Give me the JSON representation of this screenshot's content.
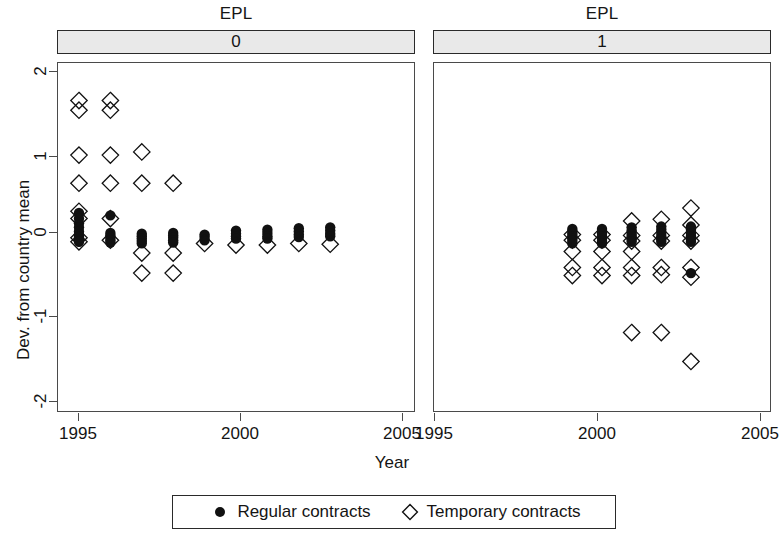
{
  "figure": {
    "strip_variable": "EPL",
    "panels": [
      {
        "strip_title": "EPL",
        "strip_value": "0"
      },
      {
        "strip_title": "EPL",
        "strip_value": "1"
      }
    ],
    "axis": {
      "ylabel": "Dev. from country mean",
      "xlabel": "Year",
      "yticks": [
        "2",
        "1",
        "0",
        "-1",
        "-2"
      ],
      "xticks": [
        "1995",
        "2000",
        "2005"
      ]
    },
    "legend": {
      "entries": [
        {
          "symbol": "filled-circle",
          "label": "Regular contracts"
        },
        {
          "symbol": "open-diamond",
          "label": "Temporary contracts"
        }
      ]
    },
    "colors": {
      "marker": "#111111",
      "strip_fill": "#e9e9e9",
      "frame": "#4a4a4a",
      "text": "#141414"
    }
  },
  "chart_data": {
    "type": "scatter",
    "title": "EPL",
    "xlabel": "Year",
    "ylabel": "Dev. from country mean",
    "xlim": [
      1994.3,
      2005.7
    ],
    "ylim": [
      -2.18,
      2.18
    ],
    "xticks": [
      1995,
      2000,
      2005
    ],
    "yticks": [
      -2,
      -1,
      0,
      1,
      2
    ],
    "grid": false,
    "legend_position": "bottom",
    "facet_variable": "EPL",
    "facets": [
      {
        "facet_value": "0",
        "series": [
          {
            "name": "Regular contracts",
            "marker": "filled-circle",
            "points": [
              {
                "x": 1995,
                "y": 0.3
              },
              {
                "x": 1995,
                "y": 0.23
              },
              {
                "x": 1995,
                "y": 0.17
              },
              {
                "x": 1995,
                "y": 0.12
              },
              {
                "x": 1995,
                "y": 0.07
              },
              {
                "x": 1995,
                "y": 0.03
              },
              {
                "x": 1995,
                "y": 0.0
              },
              {
                "x": 1995,
                "y": -0.03
              },
              {
                "x": 1995,
                "y": -0.06
              },
              {
                "x": 1996,
                "y": 0.27
              },
              {
                "x": 1996,
                "y": 0.05
              },
              {
                "x": 1996,
                "y": 0.02
              },
              {
                "x": 1996,
                "y": -0.01
              },
              {
                "x": 1996,
                "y": -0.04
              },
              {
                "x": 1996,
                "y": -0.07
              },
              {
                "x": 1997,
                "y": 0.04
              },
              {
                "x": 1997,
                "y": 0.01
              },
              {
                "x": 1997,
                "y": -0.02
              },
              {
                "x": 1997,
                "y": -0.05
              },
              {
                "x": 1997,
                "y": -0.08
              },
              {
                "x": 1998,
                "y": 0.05
              },
              {
                "x": 1998,
                "y": 0.02
              },
              {
                "x": 1998,
                "y": -0.01
              },
              {
                "x": 1998,
                "y": -0.04
              },
              {
                "x": 1998,
                "y": -0.07
              },
              {
                "x": 1999,
                "y": 0.03
              },
              {
                "x": 1999,
                "y": 0.0
              },
              {
                "x": 1999,
                "y": -0.04
              },
              {
                "x": 2000,
                "y": 0.08
              },
              {
                "x": 2000,
                "y": 0.04
              },
              {
                "x": 2000,
                "y": 0.01
              },
              {
                "x": 2000,
                "y": -0.02
              },
              {
                "x": 2001,
                "y": 0.09
              },
              {
                "x": 2001,
                "y": 0.05
              },
              {
                "x": 2001,
                "y": 0.01
              },
              {
                "x": 2001,
                "y": -0.02
              },
              {
                "x": 2002,
                "y": 0.11
              },
              {
                "x": 2002,
                "y": 0.07
              },
              {
                "x": 2002,
                "y": 0.03
              },
              {
                "x": 2002,
                "y": 0.0
              },
              {
                "x": 2003,
                "y": 0.12
              },
              {
                "x": 2003,
                "y": 0.08
              },
              {
                "x": 2003,
                "y": 0.04
              },
              {
                "x": 2003,
                "y": 0.01
              }
            ]
          },
          {
            "name": "Temporary contracts",
            "marker": "open-diamond",
            "points": [
              {
                "x": 1995,
                "y": 1.7
              },
              {
                "x": 1995,
                "y": 1.58
              },
              {
                "x": 1995,
                "y": 1.02
              },
              {
                "x": 1995,
                "y": 0.67
              },
              {
                "x": 1995,
                "y": 0.32
              },
              {
                "x": 1995,
                "y": 0.23
              },
              {
                "x": 1995,
                "y": -0.01
              },
              {
                "x": 1995,
                "y": -0.06
              },
              {
                "x": 1996,
                "y": 1.7
              },
              {
                "x": 1996,
                "y": 1.58
              },
              {
                "x": 1996,
                "y": 1.02
              },
              {
                "x": 1996,
                "y": 0.67
              },
              {
                "x": 1996,
                "y": 0.23
              },
              {
                "x": 1996,
                "y": -0.04
              },
              {
                "x": 1997,
                "y": 1.06
              },
              {
                "x": 1997,
                "y": 0.67
              },
              {
                "x": 1997,
                "y": -0.2
              },
              {
                "x": 1997,
                "y": -0.45
              },
              {
                "x": 1998,
                "y": 0.67
              },
              {
                "x": 1998,
                "y": -0.2
              },
              {
                "x": 1998,
                "y": -0.45
              },
              {
                "x": 1999,
                "y": -0.08
              },
              {
                "x": 2000,
                "y": -0.1
              },
              {
                "x": 2001,
                "y": -0.1
              },
              {
                "x": 2002,
                "y": -0.08
              },
              {
                "x": 2003,
                "y": -0.09
              }
            ]
          }
        ]
      },
      {
        "facet_value": "1",
        "series": [
          {
            "name": "Regular contracts",
            "marker": "filled-circle",
            "points": [
              {
                "x": 1999,
                "y": 0.1
              },
              {
                "x": 1999,
                "y": 0.07
              },
              {
                "x": 1999,
                "y": 0.04
              },
              {
                "x": 1999,
                "y": 0.01
              },
              {
                "x": 1999,
                "y": -0.02
              },
              {
                "x": 1999,
                "y": -0.05
              },
              {
                "x": 1999,
                "y": -0.08
              },
              {
                "x": 2000,
                "y": 0.1
              },
              {
                "x": 2000,
                "y": 0.07
              },
              {
                "x": 2000,
                "y": 0.04
              },
              {
                "x": 2000,
                "y": 0.01
              },
              {
                "x": 2000,
                "y": -0.02
              },
              {
                "x": 2000,
                "y": -0.05
              },
              {
                "x": 2000,
                "y": -0.08
              },
              {
                "x": 2001,
                "y": 0.12
              },
              {
                "x": 2001,
                "y": 0.08
              },
              {
                "x": 2001,
                "y": 0.04
              },
              {
                "x": 2001,
                "y": 0.01
              },
              {
                "x": 2001,
                "y": -0.03
              },
              {
                "x": 2001,
                "y": -0.06
              },
              {
                "x": 2002,
                "y": 0.13
              },
              {
                "x": 2002,
                "y": 0.09
              },
              {
                "x": 2002,
                "y": 0.05
              },
              {
                "x": 2002,
                "y": 0.01
              },
              {
                "x": 2002,
                "y": -0.03
              },
              {
                "x": 2002,
                "y": -0.06
              },
              {
                "x": 2003,
                "y": 0.13
              },
              {
                "x": 2003,
                "y": 0.09
              },
              {
                "x": 2003,
                "y": 0.05
              },
              {
                "x": 2003,
                "y": 0.01
              },
              {
                "x": 2003,
                "y": -0.03
              },
              {
                "x": 2003,
                "y": -0.06
              },
              {
                "x": 2003,
                "y": -0.45
              }
            ]
          },
          {
            "name": "Temporary contracts",
            "marker": "open-diamond",
            "points": [
              {
                "x": 1999,
                "y": 0.03
              },
              {
                "x": 1999,
                "y": -0.04
              },
              {
                "x": 1999,
                "y": -0.18
              },
              {
                "x": 1999,
                "y": -0.38
              },
              {
                "x": 1999,
                "y": -0.48
              },
              {
                "x": 2000,
                "y": 0.03
              },
              {
                "x": 2000,
                "y": -0.04
              },
              {
                "x": 2000,
                "y": -0.18
              },
              {
                "x": 2000,
                "y": -0.38
              },
              {
                "x": 2000,
                "y": -0.48
              },
              {
                "x": 2001,
                "y": 0.2
              },
              {
                "x": 2001,
                "y": 0.02
              },
              {
                "x": 2001,
                "y": -0.05
              },
              {
                "x": 2001,
                "y": -0.18
              },
              {
                "x": 2001,
                "y": -0.38
              },
              {
                "x": 2001,
                "y": -0.48
              },
              {
                "x": 2001,
                "y": -1.19
              },
              {
                "x": 2002,
                "y": 0.22
              },
              {
                "x": 2002,
                "y": 0.02
              },
              {
                "x": 2002,
                "y": -0.05
              },
              {
                "x": 2002,
                "y": -0.38
              },
              {
                "x": 2002,
                "y": -0.47
              },
              {
                "x": 2002,
                "y": -1.19
              },
              {
                "x": 2003,
                "y": 0.36
              },
              {
                "x": 2003,
                "y": 0.15
              },
              {
                "x": 2003,
                "y": 0.02
              },
              {
                "x": 2003,
                "y": -0.05
              },
              {
                "x": 2003,
                "y": -0.38
              },
              {
                "x": 2003,
                "y": -0.5
              },
              {
                "x": 2003,
                "y": -1.55
              }
            ]
          }
        ]
      }
    ]
  }
}
